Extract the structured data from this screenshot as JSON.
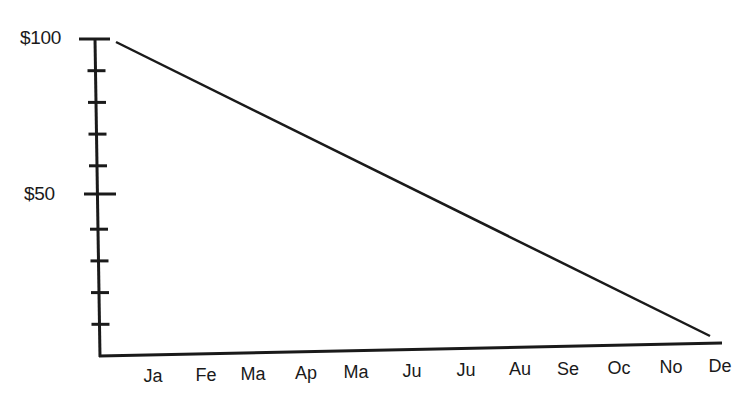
{
  "chart_data": {
    "type": "line",
    "title": "",
    "xlabel": "",
    "ylabel": "",
    "categories": [
      "Ja",
      "Fe",
      "Ma",
      "Ap",
      "Ma",
      "Ju",
      "Ju",
      "Au",
      "Se",
      "Oc",
      "No",
      "De"
    ],
    "series": [
      {
        "name": "Value",
        "start": {
          "x": "axis-start",
          "y": 100
        },
        "end": {
          "x": "De",
          "y": 0
        },
        "values": [
          91.7,
          83.3,
          75.0,
          66.7,
          58.3,
          50.0,
          41.7,
          33.3,
          25.0,
          16.7,
          8.3,
          0
        ]
      }
    ],
    "y_tick_labels": [
      "$100",
      "$50"
    ],
    "y_ticks": [
      0,
      10,
      20,
      30,
      40,
      50,
      60,
      70,
      80,
      90,
      100
    ],
    "ylim": [
      0,
      100
    ],
    "grid": false,
    "legend": "none"
  },
  "axis": {
    "y_labels": [
      {
        "text": "$100",
        "value": 100
      },
      {
        "text": "$50",
        "value": 50
      }
    ],
    "x_labels": [
      {
        "text": "Ja",
        "x": 153
      },
      {
        "text": "Fe",
        "x": 206
      },
      {
        "text": "Ma",
        "x": 253
      },
      {
        "text": "Ap",
        "x": 306
      },
      {
        "text": "Ma",
        "x": 356
      },
      {
        "text": "Ju",
        "x": 412
      },
      {
        "text": "Ju",
        "x": 466
      },
      {
        "text": "Au",
        "x": 520
      },
      {
        "text": "Se",
        "x": 568
      },
      {
        "text": "Oc",
        "x": 619
      },
      {
        "text": "No",
        "x": 671
      },
      {
        "text": "De",
        "x": 720
      }
    ]
  },
  "colors": {
    "ink": "#1a1a1a",
    "background": "#ffffff"
  }
}
